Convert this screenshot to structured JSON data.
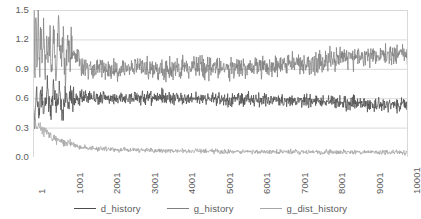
{
  "chart_data": {
    "type": "line",
    "title": "",
    "subtitle": "",
    "xlabel": "",
    "ylabel": "",
    "xlim": [
      1,
      10001
    ],
    "ylim": [
      0.0,
      1.5
    ],
    "grid": true,
    "legend_position": "bottom",
    "y_ticks": [
      "0.0",
      "0.3",
      "0.6",
      "0.9",
      "1.2",
      "1.5"
    ],
    "y_tick_values": [
      0.0,
      0.3,
      0.6,
      0.9,
      1.2,
      1.5
    ],
    "x_ticks": [
      "1",
      "1001",
      "2001",
      "3001",
      "4001",
      "5001",
      "6001",
      "7001",
      "8001",
      "9001",
      "10001"
    ],
    "x_tick_values": [
      1,
      1001,
      2001,
      3001,
      4001,
      5001,
      6001,
      7001,
      8001,
      9001,
      10001
    ],
    "series": [
      {
        "name": "d_history",
        "color": "#4d4d4d",
        "noise": 0.035,
        "seed": 11,
        "description": "discriminator loss, settles near 0.55 with steady noise band",
        "anchors": [
          [
            1,
            0.58
          ],
          [
            40,
            0.3
          ],
          [
            90,
            0.72
          ],
          [
            150,
            0.4
          ],
          [
            220,
            0.66
          ],
          [
            300,
            0.45
          ],
          [
            380,
            0.74
          ],
          [
            460,
            0.42
          ],
          [
            540,
            0.68
          ],
          [
            620,
            0.47
          ],
          [
            700,
            0.71
          ],
          [
            780,
            0.44
          ],
          [
            860,
            0.63
          ],
          [
            940,
            0.5
          ],
          [
            1010,
            0.66
          ],
          [
            1100,
            0.58
          ],
          [
            1300,
            0.6
          ],
          [
            1600,
            0.6
          ],
          [
            2000,
            0.6
          ],
          [
            2500,
            0.6
          ],
          [
            3000,
            0.61
          ],
          [
            3500,
            0.61
          ],
          [
            4000,
            0.6
          ],
          [
            4500,
            0.59
          ],
          [
            5000,
            0.59
          ],
          [
            5500,
            0.58
          ],
          [
            6000,
            0.58
          ],
          [
            6500,
            0.58
          ],
          [
            7000,
            0.57
          ],
          [
            7500,
            0.57
          ],
          [
            8000,
            0.56
          ],
          [
            8500,
            0.55
          ],
          [
            9000,
            0.54
          ],
          [
            9500,
            0.53
          ],
          [
            10001,
            0.52
          ]
        ]
      },
      {
        "name": "g_history",
        "color": "#808080",
        "noise": 0.055,
        "seed": 27,
        "description": "generator loss, very volatile early then stabilizes near 0.9 and drifts up past 1.0",
        "anchors": [
          [
            1,
            0.62
          ],
          [
            25,
            1.5
          ],
          [
            55,
            0.95
          ],
          [
            80,
            1.48
          ],
          [
            110,
            0.88
          ],
          [
            140,
            1.42
          ],
          [
            170,
            0.82
          ],
          [
            200,
            1.3
          ],
          [
            240,
            0.95
          ],
          [
            280,
            1.35
          ],
          [
            320,
            0.88
          ],
          [
            360,
            1.22
          ],
          [
            400,
            0.92
          ],
          [
            450,
            1.28
          ],
          [
            500,
            0.86
          ],
          [
            560,
            1.2
          ],
          [
            620,
            0.9
          ],
          [
            680,
            1.45
          ],
          [
            740,
            0.95
          ],
          [
            800,
            1.25
          ],
          [
            870,
            0.88
          ],
          [
            940,
            1.18
          ],
          [
            1000,
            1.05
          ],
          [
            1060,
            1.08
          ],
          [
            1130,
            1.0
          ],
          [
            1200,
            1.04
          ],
          [
            1280,
            0.95
          ],
          [
            1400,
            0.92
          ],
          [
            1600,
            0.9
          ],
          [
            1900,
            0.9
          ],
          [
            2200,
            0.89
          ],
          [
            2600,
            0.9
          ],
          [
            3000,
            0.9
          ],
          [
            3400,
            0.89
          ],
          [
            3800,
            0.9
          ],
          [
            4200,
            0.9
          ],
          [
            4600,
            0.91
          ],
          [
            5000,
            0.91
          ],
          [
            5400,
            0.91
          ],
          [
            5800,
            0.92
          ],
          [
            6200,
            0.93
          ],
          [
            6600,
            0.94
          ],
          [
            7000,
            0.96
          ],
          [
            7400,
            0.97
          ],
          [
            7800,
            0.99
          ],
          [
            8200,
            1.01
          ],
          [
            8600,
            1.02
          ],
          [
            9000,
            1.04
          ],
          [
            9400,
            1.05
          ],
          [
            9800,
            1.06
          ],
          [
            10001,
            1.05
          ]
        ]
      },
      {
        "name": "g_dist_history",
        "color": "#a6a6a6",
        "noise": 0.012,
        "seed": 43,
        "description": "generator distance, decays from about 0.35 to a flat floor near 0.05",
        "anchors": [
          [
            1,
            0.36
          ],
          [
            60,
            0.34
          ],
          [
            130,
            0.31
          ],
          [
            200,
            0.3
          ],
          [
            280,
            0.27
          ],
          [
            360,
            0.25
          ],
          [
            440,
            0.23
          ],
          [
            520,
            0.21
          ],
          [
            600,
            0.19
          ],
          [
            700,
            0.17
          ],
          [
            800,
            0.155
          ],
          [
            900,
            0.14
          ],
          [
            1000,
            0.13
          ],
          [
            1150,
            0.115
          ],
          [
            1300,
            0.1
          ],
          [
            1500,
            0.09
          ],
          [
            1700,
            0.085
          ],
          [
            1900,
            0.08
          ],
          [
            2200,
            0.075
          ],
          [
            2600,
            0.07
          ],
          [
            3000,
            0.068
          ],
          [
            3500,
            0.065
          ],
          [
            4000,
            0.062
          ],
          [
            4500,
            0.06
          ],
          [
            5000,
            0.058
          ],
          [
            5500,
            0.056
          ],
          [
            6000,
            0.054
          ],
          [
            6500,
            0.053
          ],
          [
            7000,
            0.052
          ],
          [
            7500,
            0.051
          ],
          [
            8000,
            0.05
          ],
          [
            8500,
            0.049
          ],
          [
            9000,
            0.048
          ],
          [
            9500,
            0.047
          ],
          [
            10001,
            0.046
          ]
        ]
      }
    ]
  },
  "legend": {
    "items": [
      {
        "label": "d_history",
        "color": "#4d4d4d"
      },
      {
        "label": "g_history",
        "color": "#808080"
      },
      {
        "label": "g_dist_history",
        "color": "#a6a6a6"
      }
    ]
  },
  "style": {
    "grid_color": "#d9d9d9",
    "text_color": "#5a5a5a",
    "background": "#ffffff"
  }
}
